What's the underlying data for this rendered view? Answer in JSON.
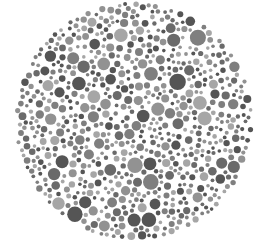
{
  "plate": {
    "kind": "color-vision-test-plate",
    "rendering": "grayscale",
    "visible_number": "",
    "center": [
      134,
      121
    ],
    "radius": 120,
    "background": "#ffffff",
    "dot_colors": [
      "#555555",
      "#6a6a6a",
      "#7f7f7f",
      "#929292",
      "#a6a6a6"
    ],
    "dot_radius_range": [
      1.8,
      8.5
    ],
    "seed": 7
  }
}
